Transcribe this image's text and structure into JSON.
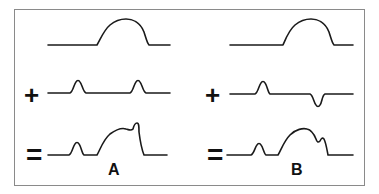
{
  "diagram": {
    "stroke_color": "#1a1a1a",
    "frame_color": "#8a8a8a",
    "panels": [
      {
        "id": "A",
        "label": "A",
        "operators": {
          "plus": "+",
          "equals": "="
        },
        "rows": [
          {
            "role": "base-waveform",
            "features": [
              "broad positive dome"
            ]
          },
          {
            "role": "added-waveform",
            "features": [
              "small positive bump",
              "small positive bump"
            ]
          },
          {
            "role": "result-waveform",
            "features": [
              "small positive bump",
              "dome with positive bump on right shoulder"
            ]
          }
        ]
      },
      {
        "id": "B",
        "label": "B",
        "operators": {
          "plus": "+",
          "equals": "="
        },
        "rows": [
          {
            "role": "base-waveform",
            "features": [
              "broad positive dome"
            ]
          },
          {
            "role": "added-waveform",
            "features": [
              "small positive bump",
              "small negative trough"
            ]
          },
          {
            "role": "result-waveform",
            "features": [
              "small positive bump",
              "dome with notch on right shoulder"
            ]
          }
        ]
      }
    ]
  }
}
